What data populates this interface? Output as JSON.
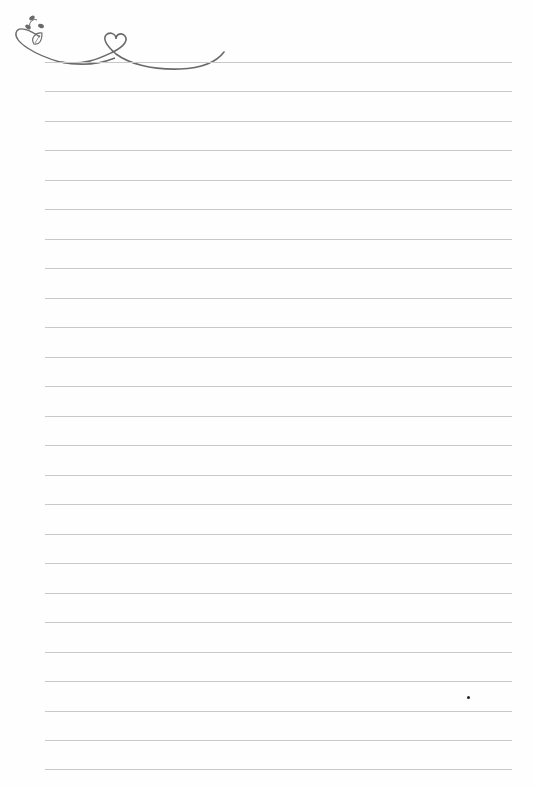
{
  "page": {
    "type": "lined-notepaper",
    "background": "#fefefe",
    "rule_color": "#c8c8c8",
    "ornament_color": "#666666",
    "rules": {
      "count": 25,
      "first_y": 62,
      "spacing": 29.5,
      "left": 45,
      "right": 512
    },
    "ornament": {
      "icon": "heart-vine-flourish-icon",
      "elements": [
        "leaf-sprig",
        "heart-loop",
        "swash-underline"
      ]
    },
    "stray_mark": {
      "x": 467,
      "y": 696
    }
  }
}
